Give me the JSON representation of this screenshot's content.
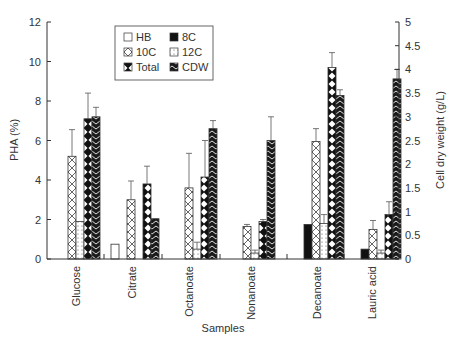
{
  "chart_data": {
    "type": "bar",
    "title": "",
    "xlabel": "Samples",
    "ylabel": "PHA (%)",
    "y2label": "Cell dry weight (g/L)",
    "ylim": [
      0,
      12
    ],
    "y2lim": [
      0,
      5
    ],
    "yticks": [
      "0",
      "2",
      "4",
      "6",
      "8",
      "10",
      "12"
    ],
    "y2ticks": [
      "0",
      "0.5",
      "1",
      "1.5",
      "2",
      "2.5",
      "3",
      "3.5",
      "4",
      "4.5",
      "5"
    ],
    "grid": false,
    "legend_position": "top-left inside",
    "categories": [
      "Glucose",
      "Citrate",
      "Octanoate",
      "Nonanoate",
      "Decanoate",
      "Lauric acid"
    ],
    "series": [
      {
        "name": "HB",
        "axis": "left",
        "pattern": "white",
        "values": [
          0,
          0.75,
          0,
          0,
          0,
          0
        ],
        "errors": [
          0,
          0,
          0,
          0,
          0,
          0
        ]
      },
      {
        "name": "8C",
        "axis": "left",
        "pattern": "black",
        "values": [
          0,
          0,
          0,
          0,
          1.75,
          0.5
        ],
        "errors": [
          0,
          0,
          0,
          0,
          0,
          0
        ]
      },
      {
        "name": "10C",
        "axis": "left",
        "pattern": "crosshatch",
        "values": [
          5.2,
          3.0,
          3.6,
          1.65,
          5.95,
          1.5
        ],
        "errors": [
          1.35,
          0.95,
          1.75,
          0.1,
          0.65,
          0.45
        ]
      },
      {
        "name": "12C",
        "axis": "left",
        "pattern": "dotted",
        "values": [
          1.9,
          0,
          0.5,
          0.3,
          1.8,
          0.3
        ],
        "errors": [
          0,
          0,
          0.35,
          0.15,
          0.45,
          0.15
        ]
      },
      {
        "name": "Total",
        "axis": "left",
        "pattern": "diamond",
        "values": [
          7.1,
          3.8,
          4.15,
          1.9,
          9.7,
          2.25
        ],
        "errors": [
          1.3,
          0.9,
          1.85,
          0.1,
          0.75,
          0.65
        ]
      },
      {
        "name": "CDW",
        "axis": "right",
        "pattern": "chevron",
        "values": [
          3.0,
          0.85,
          2.75,
          2.5,
          3.45,
          3.8
        ],
        "errors": [
          0.2,
          0,
          0.17,
          0.5,
          0.12,
          0.2
        ]
      }
    ]
  },
  "legend": {
    "items": [
      {
        "label": "HB"
      },
      {
        "label": "8C"
      },
      {
        "label": "10C"
      },
      {
        "label": "12C"
      },
      {
        "label": "Total"
      },
      {
        "label": "CDW"
      }
    ]
  }
}
